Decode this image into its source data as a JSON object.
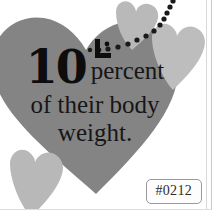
{
  "card": {
    "name": "heart-statistic-infographic",
    "background_color": "#ffffff"
  },
  "statistic": {
    "number": "10",
    "unit_word": "percent",
    "line_two": "of their body",
    "line_three": "weight.",
    "full_text": "10 percent of their body weight.",
    "text_color": "#141414"
  },
  "decorations": {
    "quote_mark_name": "stylized-quote-bracket",
    "dot_trail_name": "dotted-trail",
    "dot_color": "#1a1a1a",
    "dot_count": 13,
    "hearts": [
      {
        "id": "main-heart",
        "role": "primary background heart",
        "color": "#848484",
        "size": "large"
      },
      {
        "id": "heart-top-center",
        "role": "accent heart",
        "color": "#b9b9b9",
        "size": "small"
      },
      {
        "id": "heart-right",
        "role": "accent heart",
        "color": "#bdbdbd",
        "size": "medium"
      },
      {
        "id": "heart-bottom-left",
        "role": "accent heart",
        "color": "#b8b8b8",
        "size": "medium"
      }
    ]
  },
  "badge": {
    "label": "#0212",
    "border_color": "#9a9a9a",
    "text_color": "#2b2b2b"
  }
}
